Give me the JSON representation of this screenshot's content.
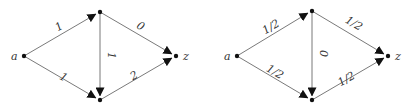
{
  "graphs": [
    {
      "id": "left",
      "nodes": {
        "a": {
          "label": "a",
          "x": 24,
          "y": 56
        },
        "u": {
          "label": "",
          "x": 100,
          "y": 12
        },
        "v": {
          "label": "",
          "x": 100,
          "y": 100
        },
        "z": {
          "label": "z",
          "x": 176,
          "y": 56
        }
      },
      "edges": [
        {
          "from": "a",
          "to": "u",
          "label": "1"
        },
        {
          "from": "a",
          "to": "v",
          "label": "1"
        },
        {
          "from": "u",
          "to": "v",
          "label": "1"
        },
        {
          "from": "u",
          "to": "z",
          "label": "0"
        },
        {
          "from": "v",
          "to": "z",
          "label": "2"
        }
      ]
    },
    {
      "id": "right",
      "nodes": {
        "a": {
          "label": "a",
          "x": 237,
          "y": 56
        },
        "u": {
          "label": "",
          "x": 312,
          "y": 11
        },
        "v": {
          "label": "",
          "x": 312,
          "y": 100
        },
        "z": {
          "label": "z",
          "x": 388,
          "y": 56
        }
      },
      "edges": [
        {
          "from": "a",
          "to": "u",
          "label": "1/2"
        },
        {
          "from": "a",
          "to": "v",
          "label": "1/2"
        },
        {
          "from": "u",
          "to": "v",
          "label": "0"
        },
        {
          "from": "u",
          "to": "z",
          "label": "1/2"
        },
        {
          "from": "v",
          "to": "z",
          "label": "1/2"
        }
      ]
    }
  ],
  "colors": {
    "edge": "#6a6a6a",
    "node": "#111111",
    "text": "#333333"
  }
}
